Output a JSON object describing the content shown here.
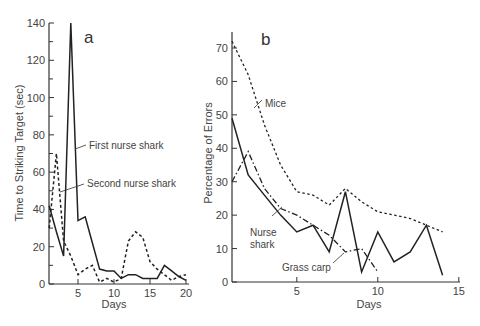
{
  "chart_data": [
    {
      "type": "line",
      "panel": "a",
      "title": "",
      "xlabel": "Days",
      "ylabel": "Time to Striking Target (sec)",
      "xlim": [
        1,
        20
      ],
      "ylim": [
        0,
        140
      ],
      "xticks": [
        5,
        10,
        15,
        20
      ],
      "yticks": [
        0,
        20,
        40,
        60,
        80,
        100,
        120,
        140
      ],
      "grid": false,
      "x": [
        1,
        2,
        3,
        4,
        5,
        6,
        7,
        8,
        9,
        10,
        11,
        12,
        13,
        14,
        15,
        16,
        17,
        18,
        19,
        20
      ],
      "series": [
        {
          "name": "First nurse shark",
          "style": "solid",
          "values": [
            42,
            28,
            15,
            140,
            34,
            36,
            22,
            8,
            7,
            7,
            3,
            5,
            5,
            3,
            3,
            3,
            10,
            7,
            4,
            2
          ]
        },
        {
          "name": "Second nurse shark",
          "style": "dashed",
          "values": [
            30,
            70,
            23,
            15,
            5,
            8,
            10,
            1,
            3,
            1,
            3,
            23,
            28,
            25,
            12,
            8,
            5,
            2,
            4,
            5
          ]
        }
      ],
      "annotations": [
        "First nurse shark",
        "Second nurse shark"
      ]
    },
    {
      "type": "line",
      "panel": "b",
      "title": "",
      "xlabel": "Days",
      "ylabel": "Percentage of Errors",
      "xlim": [
        1,
        15
      ],
      "ylim": [
        0,
        70
      ],
      "xticks": [
        5,
        10,
        15
      ],
      "yticks": [
        0,
        10,
        20,
        30,
        40,
        50,
        60,
        70
      ],
      "grid": false,
      "x": [
        1,
        2,
        3,
        4,
        5,
        6,
        7,
        8,
        9,
        10,
        11,
        12,
        13,
        14
      ],
      "series": [
        {
          "name": "Mice",
          "style": "dashed",
          "values": [
            72,
            62,
            47,
            35,
            27,
            26,
            23,
            28,
            24,
            21,
            20,
            19,
            17,
            15
          ]
        },
        {
          "name": "Nurse shark",
          "style": "solid",
          "values": [
            49,
            32,
            26,
            20,
            15,
            17,
            9,
            27,
            3,
            15,
            6,
            9,
            17,
            2
          ]
        },
        {
          "name": "Grass carp",
          "style": "dash-dot",
          "values": [
            30,
            39,
            28,
            22,
            20,
            17,
            14,
            9,
            10,
            3,
            null,
            null,
            null,
            null
          ]
        }
      ],
      "annotations": [
        "Mice",
        "Nurse shark",
        "Grass carp"
      ]
    }
  ],
  "labels": {
    "a": {
      "panel_letter": "a",
      "xlabel": "Days",
      "ylabel": "Time to Striking Target (sec)",
      "first_nurse_shark": "First nurse shark",
      "second_nurse_shark": "Second nurse shark",
      "yticks": [
        "0",
        "20",
        "40",
        "60",
        "80",
        "100",
        "120",
        "140"
      ],
      "xticks": [
        "5",
        "10",
        "15",
        "20"
      ]
    },
    "b": {
      "panel_letter": "b",
      "xlabel": "Days",
      "ylabel": "Percentage of Errors",
      "mice": "Mice",
      "nurse": "Nurse",
      "shark": "shark",
      "grass_carp": "Grass carp",
      "yticks": [
        "0",
        "10",
        "20",
        "30",
        "40",
        "50",
        "60",
        "70"
      ],
      "xticks": [
        "5",
        "10",
        "15"
      ]
    }
  }
}
